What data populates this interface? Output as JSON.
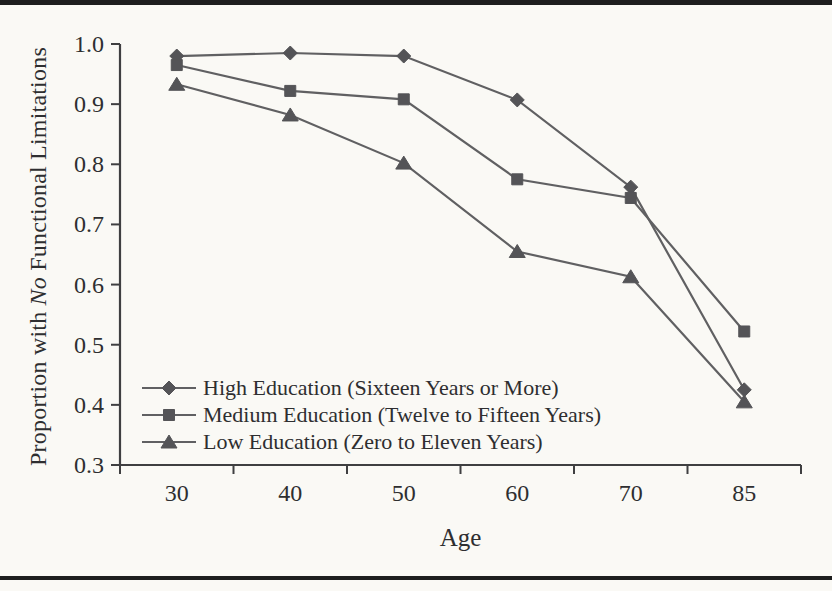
{
  "figure": {
    "background": "#faf9f5",
    "rule_color": "#1e1e1e"
  },
  "chart_data": {
    "type": "line",
    "x_categories": [
      "30",
      "40",
      "50",
      "60",
      "70",
      "85"
    ],
    "xlabel": "Age",
    "ylabel": "Proportion with No Functional Limitations",
    "ylabel_prefix": "Proportion with ",
    "ylabel_italic": "No",
    "ylabel_suffix": " Functional Limitations",
    "ylim": [
      0.3,
      1.0
    ],
    "y_ticks": [
      "1.0",
      "0.9",
      "0.8",
      "0.7",
      "0.6",
      "0.5",
      "0.4",
      "0.3"
    ],
    "y_tick_values": [
      1.0,
      0.9,
      0.8,
      0.7,
      0.6,
      0.5,
      0.4,
      0.3
    ],
    "grid": false,
    "legend_position": "inside-lower-left",
    "series": [
      {
        "name": "High Education (Sixteen Years or More)",
        "marker": "diamond",
        "values": [
          0.98,
          0.985,
          0.98,
          0.907,
          0.762,
          0.425
        ]
      },
      {
        "name": "Medium Education (Twelve to Fifteen Years)",
        "marker": "square",
        "values": [
          0.965,
          0.922,
          0.908,
          0.775,
          0.744,
          0.522
        ]
      },
      {
        "name": "Low Education (Zero to Eleven Years)",
        "marker": "triangle",
        "values": [
          0.933,
          0.882,
          0.802,
          0.655,
          0.613,
          0.405
        ]
      }
    ],
    "colors": {
      "line": "#606062",
      "marker": "#545457",
      "axis": "#3f3f41",
      "text": "#2e2e30"
    }
  }
}
